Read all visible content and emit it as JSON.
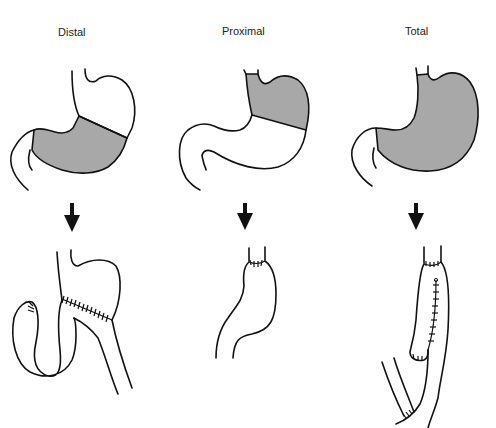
{
  "figure": {
    "columns": [
      {
        "id": "distal",
        "label": "Distal",
        "resected_region": "antrum / distal stomach (shaded)",
        "reconstruction": "gastrojejunostomy (Billroth II style) with suture line"
      },
      {
        "id": "proximal",
        "label": "Proximal",
        "resected_region": "fundus / proximal stomach (shaded)",
        "reconstruction": "esophagogastrostomy with suture line"
      },
      {
        "id": "total",
        "label": "Total",
        "resected_region": "entire stomach (shaded)",
        "reconstruction": "esophagojejunostomy with jejunal pouch and suture lines"
      }
    ],
    "arrow_icon": "down-arrow",
    "colors": {
      "shade": "#a8a8a8",
      "outline": "#111111",
      "background": "#ffffff"
    }
  }
}
